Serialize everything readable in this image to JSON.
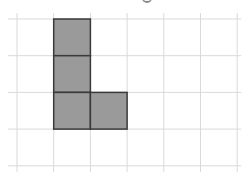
{
  "diagram": {
    "type": "polyomino-on-grid",
    "grid": {
      "columns": 6,
      "rows": 4,
      "origin_x": 17,
      "origin_y": 19,
      "cell_size": 36.7,
      "line_color": "#d9d9d9",
      "background": "#ffffff"
    },
    "shape": {
      "name": "L-tetromino",
      "fill": "#9a9a9a",
      "stroke": "#3a3a3a",
      "cells": [
        {
          "col": 1,
          "row": 0
        },
        {
          "col": 1,
          "row": 1
        },
        {
          "col": 1,
          "row": 2
        },
        {
          "col": 2,
          "row": 2
        }
      ],
      "cell_count": 4
    }
  }
}
